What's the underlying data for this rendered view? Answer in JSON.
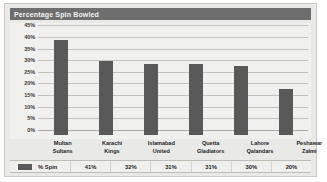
{
  "chart_data": {
    "type": "bar",
    "title": "Percentage Spin Bowled",
    "xlabel": "",
    "ylabel": "",
    "ylim": [
      0,
      45
    ],
    "grid": true,
    "legend_position": "bottom-table",
    "categories": [
      "Multan Sultans",
      "Karachi Kings",
      "Islamabad United",
      "Quetta Gladiators",
      "Lahore Qalandars",
      "Peshawar Zalmi"
    ],
    "category_lines": [
      [
        "Multan",
        "Sultans"
      ],
      [
        "Karachi",
        "Kings"
      ],
      [
        "Islamabad",
        "United"
      ],
      [
        "Quetta",
        "Gladiators"
      ],
      [
        "Lahore",
        "Qalandars"
      ],
      [
        "Peshawar",
        "Zalmi"
      ]
    ],
    "series": [
      {
        "name": "% Spin",
        "values": [
          41,
          32,
          31,
          31,
          30,
          20
        ],
        "value_labels": [
          "41%",
          "32%",
          "31%",
          "31%",
          "30%",
          "20%"
        ],
        "color": "#595959"
      }
    ],
    "y_ticks": [
      0,
      5,
      10,
      15,
      20,
      25,
      30,
      35,
      40,
      45
    ],
    "y_tick_labels": [
      "0%",
      "5%",
      "10%",
      "15%",
      "20%",
      "25%",
      "30%",
      "35%",
      "40%",
      "45%"
    ]
  },
  "colors": {
    "bar": "#595959",
    "title_bar": "#6e6e6e",
    "title_text": "#f2f2f0",
    "plot_background": "#f0f0ee",
    "frame_background": "#e9e9e7",
    "gridline": "#c2c2be"
  }
}
